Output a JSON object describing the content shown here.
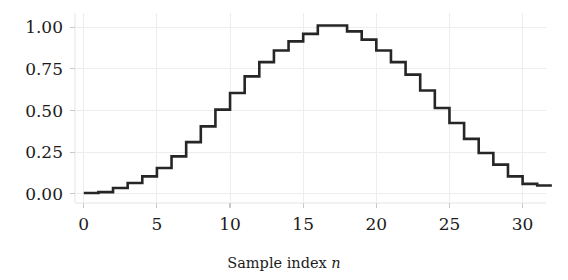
{
  "chart_data": {
    "type": "line",
    "drawstyle": "steps-post",
    "title": "",
    "subtitle": "",
    "xlabel": "Sample index n",
    "xlabel_plain": "Sample index",
    "xlabel_italic_symbol": "n",
    "ylabel": "",
    "xlim": [
      -0.6,
      31.6
    ],
    "ylim": [
      -0.055,
      1.085
    ],
    "xticks": [
      0,
      5,
      10,
      15,
      20,
      25,
      30
    ],
    "xtick_labels": [
      "0",
      "5",
      "10",
      "15",
      "20",
      "25",
      "30"
    ],
    "yticks": [
      0.0,
      0.25,
      0.5,
      0.75,
      1.0
    ],
    "ytick_labels": [
      "0.00",
      "0.25",
      "0.50",
      "0.75",
      "1.00"
    ],
    "grid": true,
    "grid_color": "#eceded",
    "legend": null,
    "legend_position": "none",
    "line_color": "#262626",
    "line_width": 2.6,
    "background_color": "#ffffff",
    "x": [
      0,
      1,
      2,
      3,
      4,
      5,
      6,
      7,
      8,
      9,
      10,
      11,
      12,
      13,
      14,
      15,
      16,
      17,
      18,
      19,
      20,
      21,
      22,
      23,
      24,
      25,
      26,
      27,
      28,
      29,
      30,
      31
    ],
    "values": [
      0.005,
      0.01,
      0.035,
      0.065,
      0.105,
      0.155,
      0.225,
      0.31,
      0.405,
      0.505,
      0.605,
      0.705,
      0.79,
      0.86,
      0.915,
      0.96,
      1.01,
      1.01,
      0.975,
      0.925,
      0.86,
      0.79,
      0.715,
      0.62,
      0.515,
      0.425,
      0.33,
      0.245,
      0.175,
      0.105,
      0.06,
      0.05
    ],
    "series": [
      {
        "name": "window",
        "values": [
          0.005,
          0.01,
          0.035,
          0.065,
          0.105,
          0.155,
          0.225,
          0.31,
          0.405,
          0.505,
          0.605,
          0.705,
          0.79,
          0.86,
          0.915,
          0.96,
          1.01,
          1.01,
          0.975,
          0.925,
          0.86,
          0.79,
          0.715,
          0.62,
          0.515,
          0.425,
          0.33,
          0.245,
          0.175,
          0.105,
          0.06,
          0.05
        ]
      }
    ]
  }
}
